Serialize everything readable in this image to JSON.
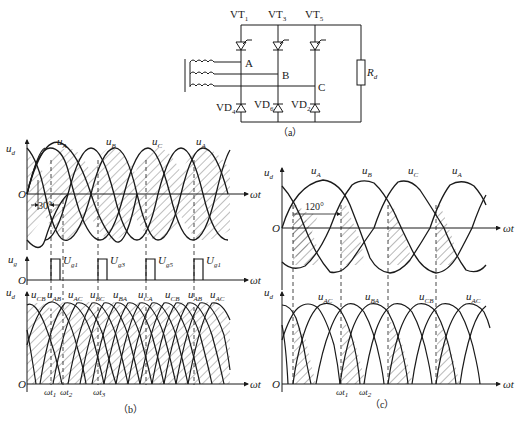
{
  "circuit": {
    "caption": "（a）",
    "thyristors": [
      {
        "label": "VT",
        "sub": "1"
      },
      {
        "label": "VT",
        "sub": "3"
      },
      {
        "label": "VT",
        "sub": "5"
      }
    ],
    "diodes": [
      {
        "label": "VD",
        "sub": "4"
      },
      {
        "label": "VD",
        "sub": "6"
      },
      {
        "label": "VD",
        "sub": "2"
      }
    ],
    "nodes": [
      "A",
      "B",
      "C"
    ],
    "load": {
      "label": "R",
      "sub": "d"
    }
  },
  "panel_b": {
    "caption": "（b）",
    "top": {
      "y_axis": {
        "label": "u",
        "sub": "d"
      },
      "x_axis": "ωt",
      "origin": "O",
      "phases": [
        {
          "label": "u",
          "sub": "A"
        },
        {
          "label": "u",
          "sub": "B"
        },
        {
          "label": "u",
          "sub": "C"
        },
        {
          "label": "u",
          "sub": "A"
        }
      ],
      "angle_annotation": "30°"
    },
    "pulses": {
      "y_axis": {
        "label": "u",
        "sub": "g"
      },
      "x_axis": "ωt",
      "origin": "O",
      "labels": [
        {
          "label": "U",
          "sub": "g1"
        },
        {
          "label": "U",
          "sub": "g3"
        },
        {
          "label": "U",
          "sub": "g5"
        },
        {
          "label": "U",
          "sub": "g1"
        }
      ]
    },
    "bottom": {
      "y_axis": {
        "label": "u",
        "sub": "d"
      },
      "x_axis": "ωt",
      "origin": "O",
      "line_voltages": [
        {
          "label": "u",
          "sub": "CB"
        },
        {
          "label": "u",
          "sub": "AB"
        },
        {
          "label": "u",
          "sub": "AC"
        },
        {
          "label": "u",
          "sub": "BC"
        },
        {
          "label": "u",
          "sub": "BA"
        },
        {
          "label": "u",
          "sub": "CA"
        },
        {
          "label": "u",
          "sub": "CB"
        },
        {
          "label": "u",
          "sub": "AB"
        },
        {
          "label": "u",
          "sub": "AC"
        }
      ],
      "time_marks": [
        {
          "label": "ωt",
          "sub": "1"
        },
        {
          "label": "ωt",
          "sub": "2"
        },
        {
          "label": "ωt",
          "sub": "3"
        }
      ]
    }
  },
  "panel_c": {
    "caption": "（c）",
    "top": {
      "y_axis": {
        "label": "u",
        "sub": "d"
      },
      "x_axis": "ωt",
      "origin": "O",
      "phases": [
        {
          "label": "u",
          "sub": "A"
        },
        {
          "label": "u",
          "sub": "B"
        },
        {
          "label": "u",
          "sub": "C"
        },
        {
          "label": "u",
          "sub": "A"
        }
      ],
      "angle_annotation": "120°"
    },
    "bottom": {
      "y_axis": {
        "label": "u",
        "sub": "d"
      },
      "x_axis": "ωt",
      "origin": "O",
      "line_voltages": [
        {
          "label": "u",
          "sub": "AC"
        },
        {
          "label": "u",
          "sub": "BA"
        },
        {
          "label": "u",
          "sub": "CB"
        },
        {
          "label": "u",
          "sub": "AC"
        }
      ],
      "time_marks": [
        {
          "label": "ωt",
          "sub": "1"
        },
        {
          "label": "ωt",
          "sub": "2"
        }
      ]
    }
  },
  "colors": {
    "ink": "#1a1a1a",
    "background": "#ffffff"
  }
}
